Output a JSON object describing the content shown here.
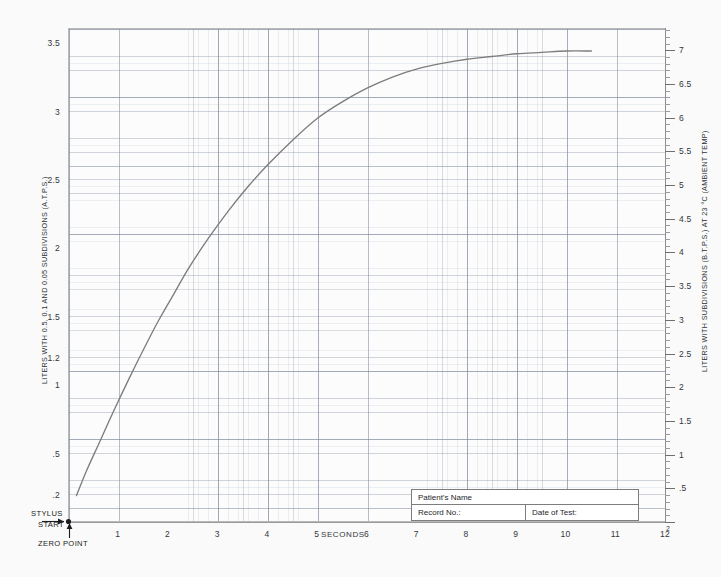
{
  "chart_data": {
    "type": "line",
    "title": "",
    "xlabel": "SECONDS",
    "ylabel": "LITERS WITH 0.5, 0.1 AND 0.05 SUBDIVISIONS (A.T.P.S.)",
    "ylabel_right": "LITERS WITH SUBDIVISIONS (B.T.P.S.) AT 23 °C (AMBIENT TEMP)",
    "xlim": [
      0,
      12
    ],
    "ylim": [
      0,
      7.1
    ],
    "ylim_right": [
      0,
      7.35
    ],
    "grid": true,
    "legend": "none",
    "line_color": "#7d7d7d",
    "x_ticks": [
      "1",
      "2",
      "3",
      "4",
      "5",
      "6",
      "7",
      "8",
      "9",
      "10",
      "11",
      "12"
    ],
    "x_tick_values": [
      1,
      2,
      3,
      4,
      5,
      6,
      7,
      8,
      9,
      10,
      11,
      12
    ],
    "y_ticks_left": [
      "6.5",
      "6",
      "5.5",
      "5",
      "4.5",
      "4",
      "3.5",
      "3",
      "2.5",
      "2",
      "1.5",
      "1.2",
      "1",
      ".5",
      ".2"
    ],
    "y_tick_values_left": [
      6.5,
      6,
      5.5,
      5,
      4.5,
      4,
      3.5,
      3,
      2.5,
      2,
      1.5,
      1.2,
      1,
      0.5,
      0.2
    ],
    "y_ticks_right": [
      "7",
      "6.5",
      "6",
      "5.5",
      "5",
      "4.5",
      "4",
      "3.5",
      "3",
      "2.5",
      "2",
      "1.5",
      "1",
      ".5"
    ],
    "y_tick_values_right": [
      7,
      6.5,
      6,
      5.5,
      5,
      4.5,
      4,
      3.5,
      3,
      2.5,
      2,
      1.5,
      1,
      0.5
    ],
    "series": [
      {
        "name": "spirogram-trace",
        "x": [
          0.15,
          0.35,
          0.6,
          0.9,
          1.2,
          1.5,
          1.8,
          2.1,
          2.4,
          2.8,
          3.2,
          3.6,
          4.0,
          4.5,
          5.0,
          5.5,
          6.0,
          6.5,
          7.0,
          7.5,
          8.0,
          8.5,
          9.0,
          9.5,
          10.0,
          10.5
        ],
        "y": [
          0.2,
          0.38,
          0.58,
          0.82,
          1.05,
          1.27,
          1.48,
          1.67,
          1.86,
          2.08,
          2.28,
          2.46,
          2.62,
          2.8,
          2.96,
          3.08,
          3.18,
          3.26,
          3.32,
          3.36,
          3.39,
          3.41,
          3.43,
          3.44,
          3.45,
          3.45
        ]
      }
    ],
    "annotations": [
      {
        "name": "stylus-start",
        "text_line1": "STYLUS",
        "text_line2": "START",
        "x": 0.15,
        "y": 0.2
      },
      {
        "name": "zero-point",
        "text": "ZERO POINT",
        "x": 0.15,
        "y": 0.0
      }
    ]
  },
  "patient_box": {
    "name_label": "Patient's Name",
    "record_label": "Record No.:",
    "date_label": "Date of Test:"
  },
  "colors": {
    "page_background": "#fafafa",
    "plot_background": "#fcfcfc",
    "grid_major": "#8795a6",
    "grid_minor": "#96a0af",
    "trace": "#7d7d7d",
    "axis": "#9a9a9a",
    "text": "#33373c"
  }
}
